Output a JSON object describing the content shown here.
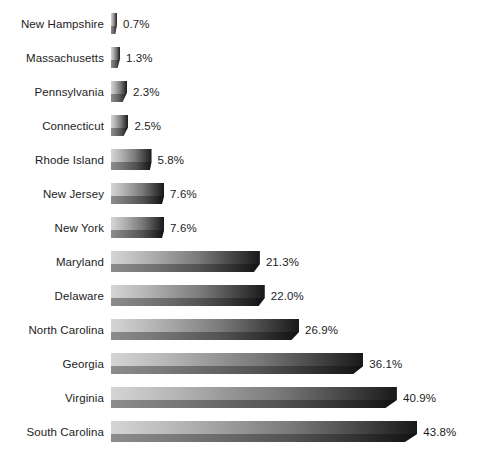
{
  "chart": {
    "title": "",
    "background_color": "#ffffff",
    "label_color": "#1c1c1c",
    "bar_light_color": "#c9c9c9",
    "bar_dark_color": "#141414"
  },
  "chart_data": {
    "type": "bar",
    "orientation": "horizontal",
    "title": "",
    "subtitle": "",
    "xlabel": "",
    "ylabel": "",
    "grid": false,
    "legend": "none",
    "axis_visible": false,
    "value_suffix": "%",
    "xlim": [
      0,
      43.8
    ],
    "categories": [
      "New Hampshire",
      "Massachusetts",
      "Pennsylvania",
      "Connecticut",
      "Rhode Island",
      "New Jersey",
      "New York",
      "Maryland",
      "Delaware",
      "North Carolina",
      "Georgia",
      "Virginia",
      "South Carolina"
    ],
    "values": [
      0.7,
      1.3,
      2.3,
      2.5,
      5.8,
      7.6,
      7.6,
      21.3,
      22.0,
      26.9,
      36.1,
      40.9,
      43.8
    ],
    "value_labels": [
      "0.7%",
      "1.3%",
      "2.3%",
      "2.5%",
      "5.8%",
      "7.6%",
      "7.6%",
      "21.3%",
      "22.0%",
      "26.9%",
      "36.1%",
      "40.9%",
      "43.8%"
    ]
  }
}
